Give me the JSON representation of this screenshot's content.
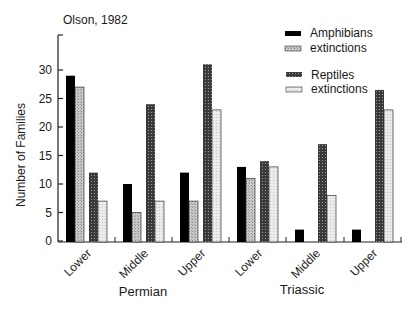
{
  "chart_data": {
    "type": "bar",
    "title": "Olson, 1982",
    "xlabel": "",
    "ylabel": "Number of Families",
    "ylim": [
      0,
      35
    ],
    "yticks": [
      0,
      5,
      10,
      15,
      20,
      25,
      30
    ],
    "grid": false,
    "legend_position": "top-right",
    "period_labels": [
      "Permian",
      "Triassic"
    ],
    "categories": [
      "Lower",
      "Middle",
      "Upper",
      "Lower",
      "Middle",
      "Upper"
    ],
    "category_period": [
      "Permian",
      "Permian",
      "Permian",
      "Triassic",
      "Triassic",
      "Triassic"
    ],
    "series": [
      {
        "name": "Amphibians",
        "values": [
          29,
          10,
          12,
          13,
          2,
          2
        ],
        "color": "#000000",
        "pattern": "solid"
      },
      {
        "name": "extinctions",
        "group": "Amphibians",
        "values": [
          27,
          5,
          7,
          11,
          0,
          0
        ],
        "color": "#b8b8b8",
        "pattern": "light-dots"
      },
      {
        "name": "Reptiles",
        "values": [
          12,
          24,
          31,
          14,
          17,
          26.5
        ],
        "color": "#555555",
        "pattern": "dark-crosshatch"
      },
      {
        "name": "extinctions",
        "group": "Reptiles",
        "values": [
          7,
          7,
          23,
          13,
          8,
          23
        ],
        "color": "#e4e4e4",
        "pattern": "very-light-dots"
      }
    ]
  },
  "legend": {
    "items": [
      {
        "label": "Amphibians"
      },
      {
        "label": "extinctions"
      },
      {
        "label": "Reptiles"
      },
      {
        "label": "extinctions"
      }
    ]
  }
}
